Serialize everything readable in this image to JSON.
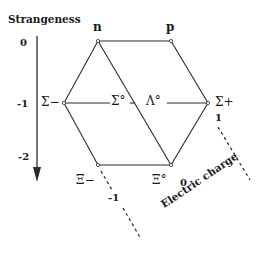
{
  "diagram": {
    "axes": {
      "strangeness": {
        "label": "Strangeness",
        "ticks": [
          "0",
          "-1",
          "-2"
        ]
      },
      "charge": {
        "label": "Electric charge",
        "ticks": [
          "-1",
          "0",
          "1"
        ]
      }
    },
    "particles": {
      "n": "n",
      "p": "p",
      "sigma_minus": "Σ−",
      "sigma_zero": "Σ°",
      "lambda_zero": "Λ°",
      "sigma_plus": "Σ+",
      "xi_minus": "Ξ−",
      "xi_zero": "Ξ°"
    },
    "colors": {
      "line": "#2a2a2a",
      "text": "#1a1a1a",
      "background": "#ffffff"
    }
  }
}
